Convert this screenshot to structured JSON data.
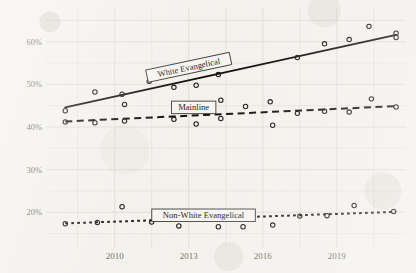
{
  "chart_data": {
    "type": "scatter",
    "title": "",
    "subtitle": "",
    "xlabel": "",
    "ylabel": "",
    "grid": true,
    "legend_position": "inline-annotations",
    "style": "hand-drawn scatter with fitted trend lines on aged paper",
    "xlim": [
      2007.3,
      2021.8
    ],
    "ylim": [
      13.5,
      66.5
    ],
    "x_ticks": [
      2010,
      2013,
      2016,
      2019
    ],
    "x_tick_labels": [
      "2010",
      "2013",
      "2016",
      "2019"
    ],
    "y_ticks": [
      20,
      30,
      40,
      50,
      60
    ],
    "y_tick_labels": [
      "20%",
      "30%",
      "40%",
      "50%",
      "60%"
    ],
    "series": [
      {
        "name": "White Evangelical",
        "marker": "open-circle",
        "line_style": "solid",
        "label_text": "White Evangelical",
        "label_rotation": -12,
        "label_x": 2013.0,
        "label_y": 54.0,
        "trend_start": {
          "x": 2008.0,
          "y": 44.6
        },
        "trend_end": {
          "x": 2021.4,
          "y": 61.6
        },
        "points": [
          {
            "x": 2008.0,
            "y": 43.8
          },
          {
            "x": 2009.2,
            "y": 48.2
          },
          {
            "x": 2010.3,
            "y": 47.7
          },
          {
            "x": 2010.4,
            "y": 45.3
          },
          {
            "x": 2011.4,
            "y": 50.7
          },
          {
            "x": 2012.4,
            "y": 49.3
          },
          {
            "x": 2013.3,
            "y": 49.8
          },
          {
            "x": 2014.2,
            "y": 52.3
          },
          {
            "x": 2014.3,
            "y": 46.3
          },
          {
            "x": 2015.3,
            "y": 44.8
          },
          {
            "x": 2016.3,
            "y": 45.9
          },
          {
            "x": 2017.4,
            "y": 56.3
          },
          {
            "x": 2018.5,
            "y": 59.5
          },
          {
            "x": 2019.5,
            "y": 60.5
          },
          {
            "x": 2020.3,
            "y": 63.6
          },
          {
            "x": 2021.4,
            "y": 62.0
          },
          {
            "x": 2021.4,
            "y": 61.0
          }
        ]
      },
      {
        "name": "Mainline",
        "marker": "open-circle",
        "line_style": "dashed",
        "label_text": "Mainline",
        "label_rotation": 0,
        "label_x": 2013.2,
        "label_y": 44.6,
        "trend_start": {
          "x": 2008.0,
          "y": 41.3
        },
        "trend_end": {
          "x": 2021.4,
          "y": 44.9
        },
        "points": [
          {
            "x": 2008.0,
            "y": 41.2
          },
          {
            "x": 2009.2,
            "y": 41.0
          },
          {
            "x": 2010.4,
            "y": 41.4
          },
          {
            "x": 2012.4,
            "y": 41.8
          },
          {
            "x": 2013.3,
            "y": 40.7
          },
          {
            "x": 2014.3,
            "y": 42.0
          },
          {
            "x": 2016.4,
            "y": 40.4
          },
          {
            "x": 2017.4,
            "y": 43.2
          },
          {
            "x": 2018.5,
            "y": 43.7
          },
          {
            "x": 2019.5,
            "y": 43.5
          },
          {
            "x": 2020.4,
            "y": 46.6
          },
          {
            "x": 2021.4,
            "y": 44.7
          }
        ]
      },
      {
        "name": "Non-White Evangelical",
        "marker": "open-circle",
        "line_style": "dotted",
        "label_text": "Non-White Evangelical",
        "label_rotation": 0,
        "label_x": 2013.6,
        "label_y": 19.3,
        "trend_start": {
          "x": 2008.0,
          "y": 17.4
        },
        "trend_end": {
          "x": 2021.4,
          "y": 20.1
        },
        "points": [
          {
            "x": 2008.0,
            "y": 17.3
          },
          {
            "x": 2009.3,
            "y": 17.6
          },
          {
            "x": 2010.3,
            "y": 21.3
          },
          {
            "x": 2011.5,
            "y": 17.7
          },
          {
            "x": 2012.5,
            "y": 19.5
          },
          {
            "x": 2012.6,
            "y": 16.8
          },
          {
            "x": 2014.2,
            "y": 16.6
          },
          {
            "x": 2015.2,
            "y": 16.6
          },
          {
            "x": 2016.4,
            "y": 17.0
          },
          {
            "x": 2017.5,
            "y": 19.1
          },
          {
            "x": 2018.6,
            "y": 19.2
          },
          {
            "x": 2019.7,
            "y": 21.6
          },
          {
            "x": 2021.3,
            "y": 20.2
          }
        ]
      }
    ]
  }
}
